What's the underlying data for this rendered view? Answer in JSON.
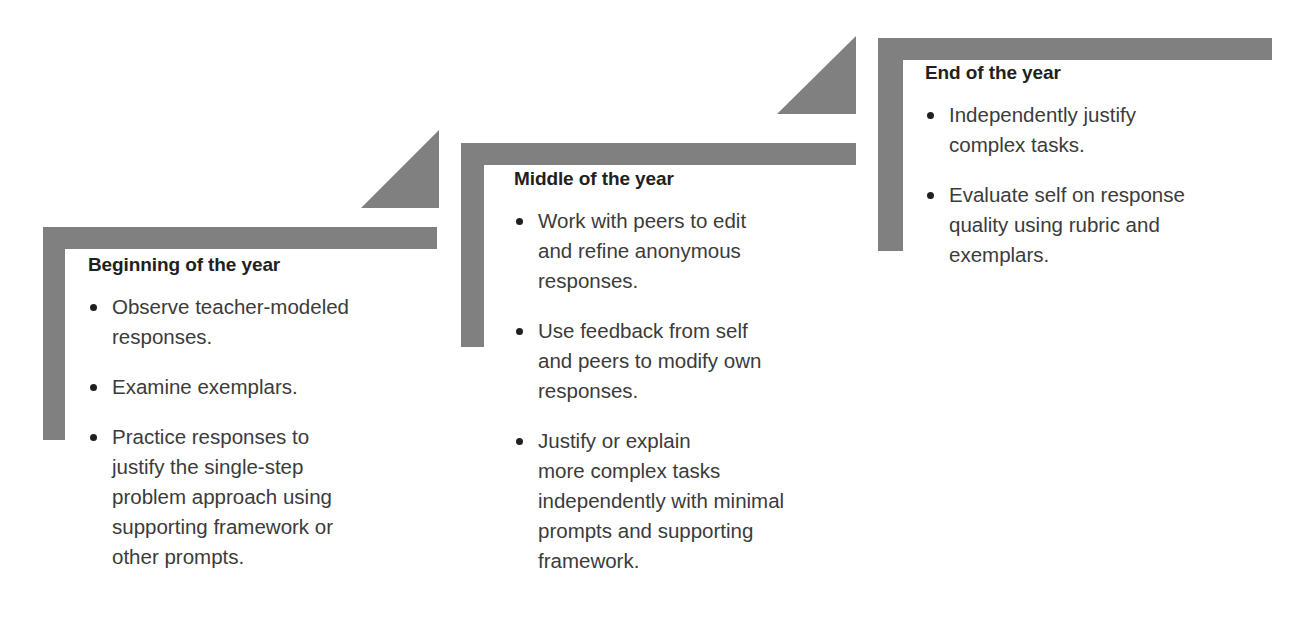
{
  "diagram": {
    "name": "year-progression-flow",
    "width": 1316,
    "height": 619,
    "background_color": "#ffffff",
    "bracket_color": "#808080",
    "title_color": "#231f20",
    "body_text_color": "#3b3b3b",
    "bullet_marker": "•"
  },
  "stages": [
    {
      "id": "beginning",
      "title": "Beginning of the year",
      "bullets": [
        "Observe teacher-modeled\nresponses.",
        "Examine exemplars.",
        "Practice responses to\njustify the single-step\nproblem approach using\nsupporting framework or\nother prompts."
      ]
    },
    {
      "id": "middle",
      "title": "Middle of the year",
      "bullets": [
        "Work with peers to edit\nand refine anonymous\nresponses.",
        "Use feedback from self\nand peers to modify own\nresponses.",
        "Justify or explain\nmore complex tasks\nindependently with minimal\nprompts and supporting\nframework."
      ]
    },
    {
      "id": "end",
      "title": "End of the year",
      "bullets": [
        "Independently justify\ncomplex tasks.",
        "Evaluate self on response\nquality using rubric and\nexemplars."
      ]
    }
  ],
  "connectors": [
    {
      "id": "connector-beginning-to-middle",
      "shape": "right-triangle-arrow"
    },
    {
      "id": "connector-middle-to-end",
      "shape": "right-triangle-arrow"
    }
  ]
}
